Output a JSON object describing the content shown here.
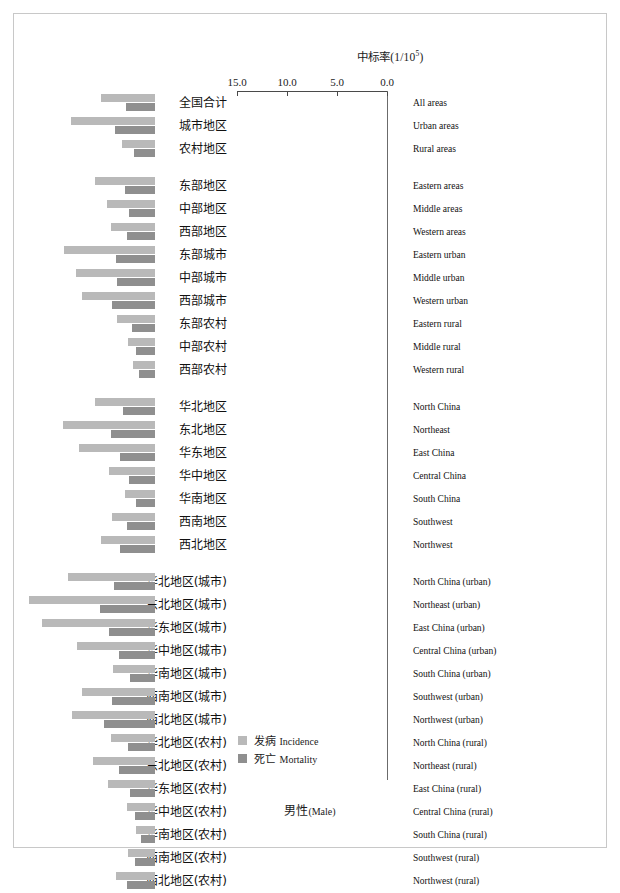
{
  "axis": {
    "title_cn": "中标率(1/10",
    "title_sup": "5",
    "title_close": ")",
    "ticks": [
      "15.0",
      "10.0",
      "5.0",
      "0.0"
    ],
    "tick_values": [
      15.0,
      10.0,
      5.0,
      0.0
    ]
  },
  "legend": {
    "incidence": "发病 Incidence",
    "incidence_cn": "发病",
    "incidence_en": "Incidence",
    "mortality": "死亡 Mortality",
    "mortality_cn": "死亡",
    "mortality_en": "Mortality",
    "incidence_color": "#b9b9b9",
    "mortality_color": "#8f8f8f"
  },
  "footer": {
    "cn": "男性",
    "en": "(Male)"
  },
  "chart_data": {
    "type": "bar",
    "orientation": "horizontal-reversed",
    "xlabel": "中标率(1/10^5)",
    "ylabel": "",
    "xlim": [
      15.0,
      0.0
    ],
    "grid": false,
    "legend_position": "bottom-left",
    "categories_cn": [
      "全国合计",
      "城市地区",
      "农村地区",
      "东部地区",
      "中部地区",
      "西部地区",
      "东部城市",
      "中部城市",
      "西部城市",
      "东部农村",
      "中部农村",
      "西部农村",
      "华北地区",
      "东北地区",
      "华东地区",
      "华中地区",
      "华南地区",
      "西南地区",
      "西北地区",
      "华北地区(城市)",
      "东北地区(城市)",
      "华东地区(城市)",
      "华中地区(城市)",
      "华南地区(城市)",
      "西南地区(城市)",
      "西北地区(城市)",
      "华北地区(农村)",
      "东北地区(农村)",
      "华东地区(农村)",
      "华中地区(农村)",
      "华南地区(农村)",
      "西南地区(农村)",
      "西北地区(农村)"
    ],
    "categories_en": [
      "All areas",
      "Urban areas",
      "Rural areas",
      "Eastern areas",
      "Middle areas",
      "Western areas",
      "Eastern urban",
      "Middle urban",
      "Western urban",
      "Eastern rural",
      "Middle rural",
      "Western rural",
      "North China",
      "Northeast",
      "East China",
      "Central China",
      "South China",
      "Southwest",
      "Northwest",
      "North China (urban)",
      "Northeast (urban)",
      "East China (urban)",
      "Central China (urban)",
      "South China (urban)",
      "Southwest (urban)",
      "Northwest (urban)",
      "North China (rural)",
      "Northeast (rural)",
      "East China (rural)",
      "Central China (rural)",
      "South China (rural)",
      "Southwest (rural)",
      "Northwest (rural)"
    ],
    "group_breaks_after": [
      2,
      11,
      18
    ],
    "series": [
      {
        "name": "发病 Incidence",
        "color": "#b9b9b9",
        "values": [
          5.4,
          8.4,
          3.3,
          6.0,
          4.8,
          4.4,
          9.1,
          7.9,
          7.3,
          3.8,
          2.7,
          2.2,
          6.0,
          9.2,
          7.6,
          4.6,
          3.0,
          4.3,
          5.4,
          8.7,
          12.6,
          11.3,
          7.8,
          4.2,
          7.3,
          8.3,
          4.4,
          6.2,
          4.7,
          2.8,
          1.9,
          2.7,
          3.9
        ]
      },
      {
        "name": "死亡 Mortality",
        "color": "#8f8f8f",
        "values": [
          2.9,
          4.0,
          2.1,
          3.0,
          2.6,
          2.8,
          3.9,
          3.8,
          4.3,
          2.3,
          1.9,
          1.6,
          3.2,
          4.4,
          3.5,
          2.6,
          1.9,
          2.8,
          3.5,
          4.1,
          5.5,
          4.6,
          3.6,
          2.5,
          4.3,
          5.1,
          2.7,
          3.6,
          2.5,
          2.0,
          1.4,
          2.0,
          2.8
        ]
      }
    ]
  }
}
